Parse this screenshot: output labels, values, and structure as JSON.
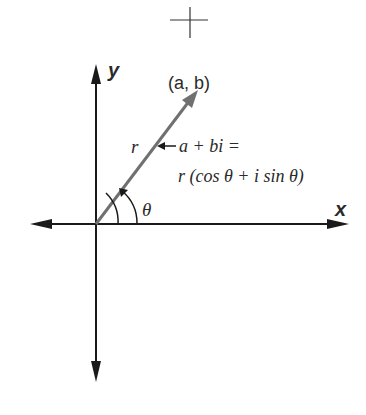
{
  "figure": {
    "type": "complex-plane-polar-form",
    "axes": {
      "x_label": "x",
      "y_label": "y"
    },
    "point_label": "(a, b)",
    "vector_label": "r",
    "angle_label": "θ",
    "equation": {
      "line1": "a + bi =",
      "line2": "r (cos θ + i sin θ)"
    },
    "colors": {
      "axis": "#1a1a1a",
      "vector": "#707070",
      "text": "#2a2a2a"
    }
  }
}
